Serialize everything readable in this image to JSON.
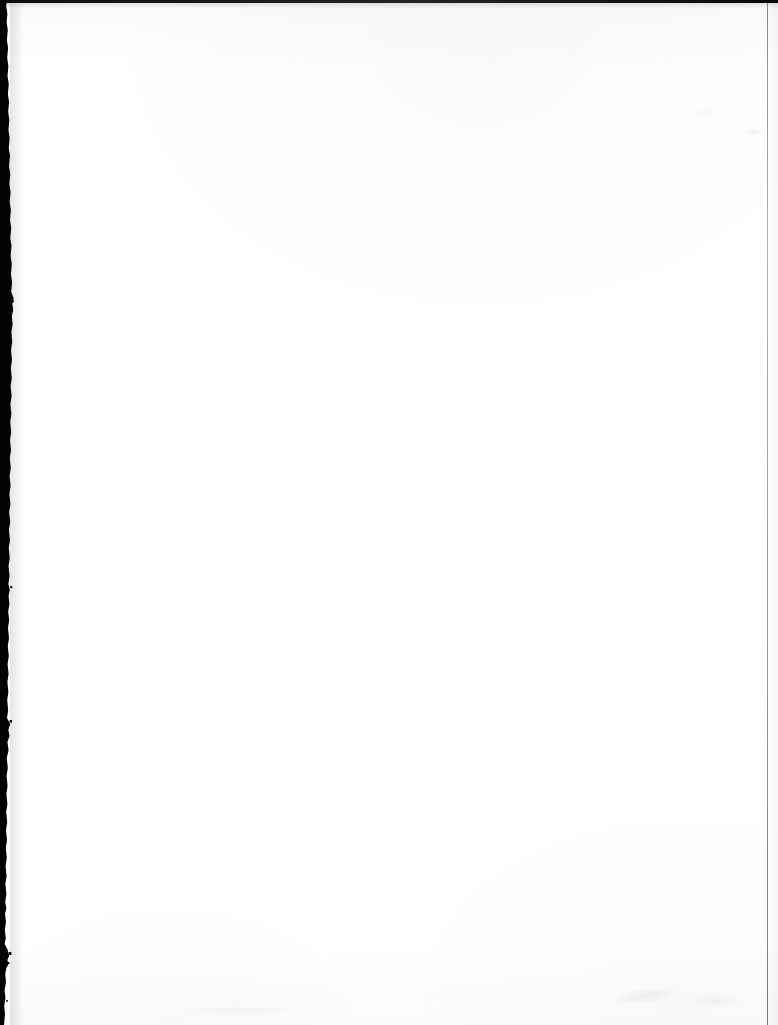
{
  "document": {
    "type": "scanned-page",
    "state": "blank",
    "width_px": 778,
    "height_px": 1025,
    "orientation": "portrait",
    "visible_text": "",
    "body_text_lines": [],
    "page_number": "",
    "header": "",
    "footer": ""
  },
  "colors": {
    "paper": "#ffffff",
    "paper_shade": "#fbfbfb",
    "left_edge_band": "#000000",
    "top_edge_line": "#1a1a1a",
    "right_edge_rule": "#3a3a3a",
    "smudge": "rgba(0,0,0,0.05)"
  },
  "artifacts": [
    {
      "name": "left-edge-shadow-band",
      "description": "dark ragged vertical band along the left margin",
      "edge": "left",
      "approx_width_px": 12
    },
    {
      "name": "top-edge-line",
      "description": "thin dark horizontal line across the top",
      "edge": "top",
      "approx_height_px": 3
    },
    {
      "name": "right-edge-rule",
      "description": "thin gray vertical rule near the right edge",
      "edge": "right",
      "approx_width_px": 1
    },
    {
      "name": "scan-banding",
      "description": "faint horizontal tonal banding near top and bottom",
      "edge": "top-bottom"
    },
    {
      "name": "smudges",
      "description": "faint gray smudges near the bottom-right and upper-right",
      "edge": "interior"
    }
  ]
}
